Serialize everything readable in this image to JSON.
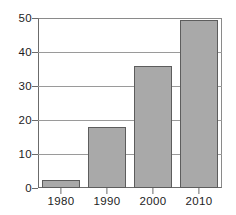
{
  "chart_data": {
    "type": "bar",
    "title": "",
    "subtitle": "",
    "xlabel": "",
    "ylabel": "",
    "categories": [
      "1980",
      "1990",
      "2000",
      "2010"
    ],
    "values": [
      2.5,
      18,
      36,
      49.5
    ],
    "series": [
      {
        "name": "",
        "values": [
          2.5,
          18,
          36,
          49.5
        ]
      }
    ],
    "ylim": [
      0,
      50
    ],
    "yticks": [
      0,
      10,
      20,
      30,
      40,
      50
    ],
    "ytick_labels": [
      "0",
      "10",
      "20",
      "30",
      "40",
      "50"
    ],
    "xtick_labels": [
      "1980",
      "1990",
      "2000",
      "2010"
    ],
    "grid": "horizontal",
    "legend": "none",
    "annotations": [],
    "colors": {
      "bar_fill": "#a9a9a9",
      "bar_edge": "#5d5d5d",
      "gridline": "#9a9a9a",
      "axis": "#6b6b6b",
      "text": "#1d1d1d",
      "background": "#ffffff"
    }
  }
}
